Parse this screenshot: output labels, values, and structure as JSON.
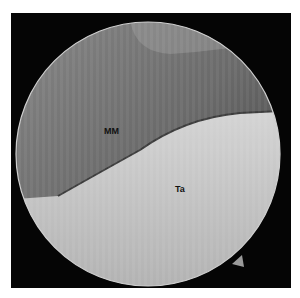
{
  "image": {
    "description": "Arthroscopic circular view",
    "labels": [
      {
        "text": "MM",
        "x": 104,
        "y": 126
      },
      {
        "text": "Ta",
        "x": 175,
        "y": 184
      }
    ],
    "colors": {
      "border": "#ffffff",
      "background": "#050505",
      "upper_tissue": "#6e6e6e",
      "lower_tissue": "#c8c8c8"
    }
  }
}
